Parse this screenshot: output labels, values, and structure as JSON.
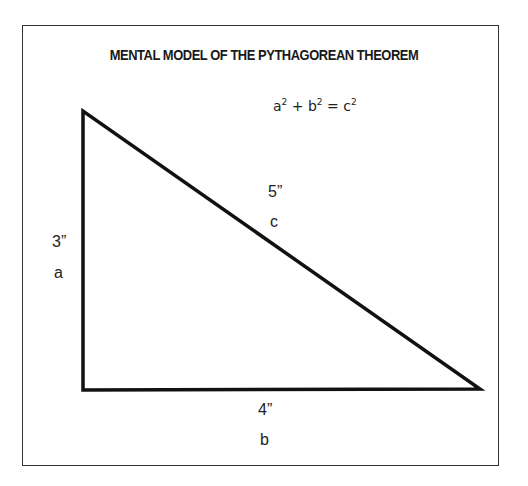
{
  "title": "MENTAL MODEL OF THE PYTHAGOREAN THEOREM",
  "equation": {
    "a": "a",
    "b": "b",
    "c": "c",
    "exp": "2",
    "plus": "+",
    "equals": "="
  },
  "sides": {
    "a": {
      "length": "3”",
      "name": "a"
    },
    "b": {
      "length": "4”",
      "name": "b"
    },
    "c": {
      "length": "5”",
      "name": "c"
    }
  },
  "triangle": {
    "vertices": [
      [
        83,
        111
      ],
      [
        83,
        390
      ],
      [
        480,
        389
      ]
    ],
    "stroke": "#111111"
  }
}
